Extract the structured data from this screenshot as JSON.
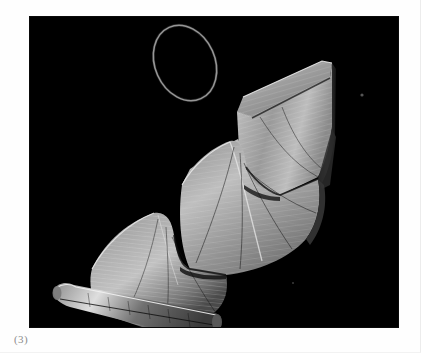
{
  "page": {
    "background_color": "#fefefe",
    "caption": "(3)",
    "caption_color": "#8d8d8d"
  },
  "figure": {
    "frame": {
      "x": 30,
      "y": 17,
      "width": 368,
      "height": 310,
      "background_color": "#000000"
    },
    "title": "",
    "render_type": "3d-wireframe-surface",
    "subject_name": "minimal-surface-with-boundary-ring",
    "palette": {
      "background": "#000000",
      "mesh_line": "#d8d8d8",
      "surface_light": "#cfcfcf",
      "surface_mid": "#8e8e8e",
      "surface_dark": "#3a3a3a",
      "highlight": "#f0f0f0",
      "ring_stroke": "#b9b9b9"
    },
    "components": [
      {
        "name": "boundary-ring",
        "label": "floating closed boundary curve",
        "cx": 185,
        "cy": 63,
        "rx": 30,
        "ry": 38,
        "rotation_deg": -28
      },
      {
        "name": "terrace-upper",
        "label": "upper terrace fold",
        "level": 1
      },
      {
        "name": "terrace-middle",
        "label": "middle saddle fold",
        "level": 2
      },
      {
        "name": "terrace-lower",
        "label": "lower curled fold",
        "level": 3
      },
      {
        "name": "saddle-neck",
        "label": "central pinched neck",
        "level": 2
      }
    ],
    "specks": [
      {
        "name": "speck-right",
        "x": 362,
        "y": 95,
        "size": 2
      },
      {
        "name": "speck-lower",
        "x": 293,
        "y": 283,
        "size": 1
      }
    ],
    "mesh": {
      "u_lines": 46,
      "v_lines": 18,
      "style": "fine parallel grid with radiating geodesic curves"
    }
  }
}
